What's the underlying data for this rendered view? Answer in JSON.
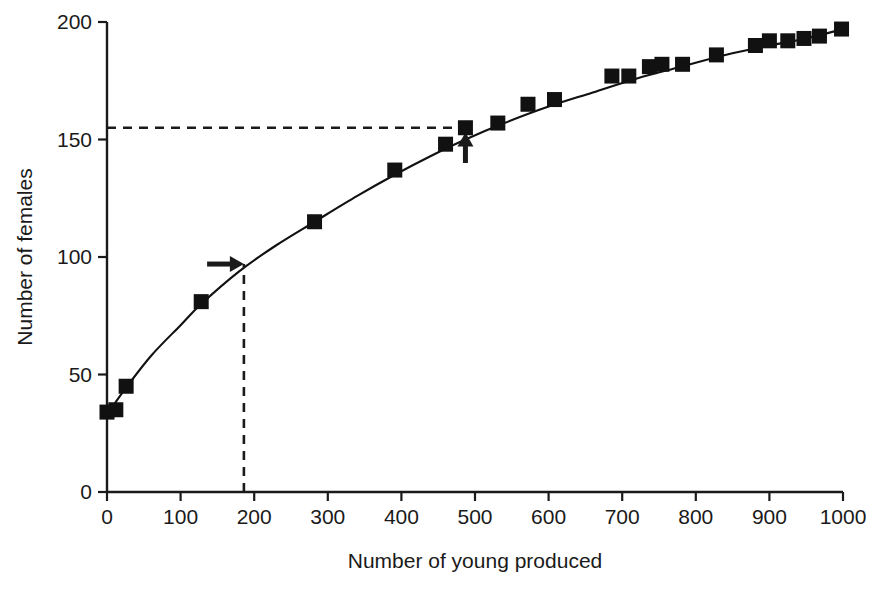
{
  "chart_data": {
    "type": "scatter",
    "title": "",
    "xlabel": "Number of young produced",
    "ylabel": "Number of females",
    "xlim": [
      0,
      1000
    ],
    "ylim": [
      0,
      200
    ],
    "xticks": [
      0,
      100,
      200,
      300,
      400,
      500,
      600,
      700,
      800,
      900,
      1000
    ],
    "yticks": [
      0,
      50,
      100,
      150,
      200
    ],
    "xtick_labels": [
      "0",
      "100",
      "200",
      "300",
      "400",
      "500",
      "600",
      "700",
      "800",
      "900",
      "1000"
    ],
    "ytick_labels": [
      "0",
      "50",
      "100",
      "150",
      "200"
    ],
    "grid": false,
    "legend": null,
    "marker": "filled-square",
    "marker_color": "#111111",
    "line_color": "#111111",
    "points": [
      {
        "x": 0,
        "y": 34
      },
      {
        "x": 12,
        "y": 35
      },
      {
        "x": 26,
        "y": 45
      },
      {
        "x": 128,
        "y": 81
      },
      {
        "x": 282,
        "y": 115
      },
      {
        "x": 391,
        "y": 137
      },
      {
        "x": 460,
        "y": 148
      },
      {
        "x": 487,
        "y": 155
      },
      {
        "x": 531,
        "y": 157
      },
      {
        "x": 572,
        "y": 165
      },
      {
        "x": 608,
        "y": 167
      },
      {
        "x": 686,
        "y": 177
      },
      {
        "x": 709,
        "y": 177
      },
      {
        "x": 737,
        "y": 181
      },
      {
        "x": 754,
        "y": 182
      },
      {
        "x": 782,
        "y": 182
      },
      {
        "x": 828,
        "y": 186
      },
      {
        "x": 881,
        "y": 190
      },
      {
        "x": 900,
        "y": 192
      },
      {
        "x": 925,
        "y": 192
      },
      {
        "x": 947,
        "y": 193
      },
      {
        "x": 968,
        "y": 194
      },
      {
        "x": 998,
        "y": 197
      }
    ],
    "fit_curve": [
      {
        "x": 0,
        "y": 33
      },
      {
        "x": 25,
        "y": 44
      },
      {
        "x": 60,
        "y": 58
      },
      {
        "x": 100,
        "y": 71
      },
      {
        "x": 128,
        "y": 80
      },
      {
        "x": 180,
        "y": 94
      },
      {
        "x": 230,
        "y": 105
      },
      {
        "x": 282,
        "y": 115
      },
      {
        "x": 340,
        "y": 126
      },
      {
        "x": 391,
        "y": 135
      },
      {
        "x": 440,
        "y": 143
      },
      {
        "x": 487,
        "y": 150
      },
      {
        "x": 540,
        "y": 157
      },
      {
        "x": 600,
        "y": 164
      },
      {
        "x": 660,
        "y": 170
      },
      {
        "x": 720,
        "y": 176
      },
      {
        "x": 780,
        "y": 181
      },
      {
        "x": 840,
        "y": 186
      },
      {
        "x": 900,
        "y": 190
      },
      {
        "x": 950,
        "y": 193
      },
      {
        "x": 1000,
        "y": 197
      }
    ],
    "annotations": [
      {
        "name": "horizontal-dashed-line",
        "kind": "dashed-line",
        "orientation": "horizontal",
        "y": 155,
        "x_from": 0,
        "x_to": 487
      },
      {
        "name": "vertical-dashed-line",
        "kind": "dashed-line",
        "orientation": "vertical",
        "x": 186,
        "y_from": 0,
        "y_to": 97
      },
      {
        "name": "right-arrow",
        "kind": "arrow",
        "direction": "right",
        "y": 97,
        "x_from": 136,
        "x_to": 186
      },
      {
        "name": "up-arrow",
        "kind": "arrow",
        "direction": "up",
        "x": 487,
        "y_from": 140,
        "y_to": 153
      }
    ]
  },
  "colors": {
    "axis": "#1a1a1a",
    "marker": "#111111",
    "curve": "#111111",
    "background": "#ffffff"
  }
}
